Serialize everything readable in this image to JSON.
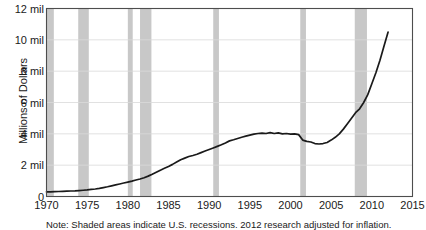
{
  "chart_data": {
    "type": "line",
    "title": "",
    "xlabel": "",
    "ylabel": "Millions of Dollars",
    "xlim": [
      1970,
      2015
    ],
    "ylim": [
      0,
      12
    ],
    "grid": true,
    "legend_position": "none",
    "y_tick_labels": [
      "0",
      "2 mil",
      "4 mil",
      "6 mil",
      "8 mil",
      "10 mil",
      "12 mil"
    ],
    "y_tick_values": [
      0,
      2,
      4,
      6,
      8,
      10,
      12
    ],
    "x_tick_labels": [
      "1970",
      "1975",
      "1980",
      "1985",
      "1990",
      "1995",
      "2000",
      "2005",
      "2010",
      "2015"
    ],
    "x_tick_values": [
      1970,
      1975,
      1980,
      1985,
      1990,
      1995,
      2000,
      2005,
      2010,
      2015
    ],
    "series": [
      {
        "name": "Millions of Dollars",
        "color": "#1a1a1a",
        "x": [
          1970,
          1970.5,
          1971,
          1971.5,
          1972,
          1972.5,
          1973,
          1973.5,
          1974,
          1974.5,
          1975,
          1975.5,
          1976,
          1976.5,
          1977,
          1977.5,
          1978,
          1978.5,
          1979,
          1979.5,
          1980,
          1980.5,
          1981,
          1981.5,
          1982,
          1982.5,
          1983,
          1983.5,
          1984,
          1984.5,
          1985,
          1985.5,
          1986,
          1986.5,
          1987,
          1987.5,
          1988,
          1988.5,
          1989,
          1989.5,
          1990,
          1990.5,
          1991,
          1991.5,
          1992,
          1992.5,
          1993,
          1993.5,
          1994,
          1994.5,
          1995,
          1995.5,
          1996,
          1996.5,
          1997,
          1997.5,
          1998,
          1998.5,
          1999,
          1999.5,
          2000,
          2000.5,
          2001,
          2001.5,
          2002,
          2002.5,
          2003,
          2003.5,
          2004,
          2004.5,
          2005,
          2005.5,
          2006,
          2006.5,
          2007,
          2007.5,
          2008,
          2008.5,
          2009,
          2009.5,
          2010,
          2010.5,
          2011,
          2011.5,
          2012
        ],
        "y": [
          0.3,
          0.3,
          0.31,
          0.32,
          0.33,
          0.34,
          0.35,
          0.36,
          0.38,
          0.4,
          0.42,
          0.45,
          0.48,
          0.52,
          0.57,
          0.62,
          0.68,
          0.74,
          0.8,
          0.86,
          0.92,
          0.98,
          1.05,
          1.12,
          1.2,
          1.3,
          1.42,
          1.55,
          1.68,
          1.8,
          1.92,
          2.05,
          2.2,
          2.35,
          2.45,
          2.55,
          2.62,
          2.7,
          2.8,
          2.9,
          3.0,
          3.1,
          3.2,
          3.3,
          3.42,
          3.55,
          3.62,
          3.7,
          3.78,
          3.85,
          3.92,
          3.98,
          4.02,
          4.05,
          4.02,
          4.08,
          4.02,
          4.06,
          4.0,
          4.02,
          3.98,
          4.0,
          3.95,
          3.6,
          3.52,
          3.48,
          3.38,
          3.35,
          3.38,
          3.45,
          3.6,
          3.78,
          4.0,
          4.3,
          4.65,
          5.0,
          5.35,
          5.6,
          6.0,
          6.5,
          7.2,
          7.9,
          8.7,
          9.6,
          10.5
        ]
      }
    ],
    "recession_bands": [
      {
        "start": 1969.9,
        "end": 1970.9
      },
      {
        "start": 1973.9,
        "end": 1975.2
      },
      {
        "start": 1980.0,
        "end": 1980.6
      },
      {
        "start": 1981.5,
        "end": 1982.9
      },
      {
        "start": 1990.5,
        "end": 1991.2
      },
      {
        "start": 2001.2,
        "end": 2001.9
      },
      {
        "start": 2007.9,
        "end": 2009.4
      }
    ],
    "recession_band_color": "#c8c8c8",
    "grid_color": "#d9d9d9",
    "axis_color": "#4d4d4d",
    "plot_background": "#ffffff"
  },
  "caption": {
    "text": "Note: Shaded areas indicate U.S. recessions. 2012 research adjusted for inflation."
  }
}
